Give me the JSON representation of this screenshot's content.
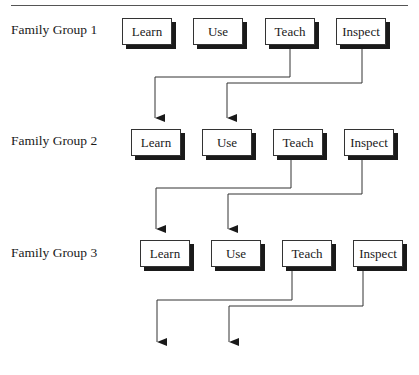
{
  "header": {
    "rule_visible": true,
    "cut_off_text": "…"
  },
  "groups": [
    {
      "label": "Family Group 1",
      "label_y": 24,
      "boxes": [
        {
          "label": "Learn",
          "x": 122,
          "y": 18
        },
        {
          "label": "Use",
          "x": 193,
          "y": 18
        },
        {
          "label": "Teach",
          "x": 265,
          "y": 18
        },
        {
          "label": "Inspect",
          "x": 336,
          "y": 18
        }
      ]
    },
    {
      "label": "Family Group 2",
      "label_y": 135,
      "boxes": [
        {
          "label": "Learn",
          "x": 131,
          "y": 129
        },
        {
          "label": "Use",
          "x": 202,
          "y": 129
        },
        {
          "label": "Teach",
          "x": 273,
          "y": 129
        },
        {
          "label": "Inspect",
          "x": 344,
          "y": 129
        }
      ]
    },
    {
      "label": "Family Group 3",
      "label_y": 247,
      "boxes": [
        {
          "label": "Learn",
          "x": 140,
          "y": 240
        },
        {
          "label": "Use",
          "x": 211,
          "y": 240
        },
        {
          "label": "Teach",
          "x": 282,
          "y": 240
        },
        {
          "label": "Inspect",
          "x": 353,
          "y": 240
        }
      ]
    }
  ],
  "connectors": [
    {
      "from": "Group 1 Teach",
      "to": "Group 2 Learn"
    },
    {
      "from": "Group 1 Inspect",
      "to": "Group 2 Use"
    },
    {
      "from": "Group 2 Teach",
      "to": "Group 3 Learn"
    },
    {
      "from": "Group 2 Inspect",
      "to": "Group 3 Use"
    },
    {
      "from": "Group 3 Teach",
      "to": "next group Learn"
    },
    {
      "from": "Group 3 Inspect",
      "to": "next group Use"
    }
  ],
  "colors": {
    "line": "#333333",
    "shadow": "#1a1a1a",
    "box_fill": "#ffffff"
  }
}
